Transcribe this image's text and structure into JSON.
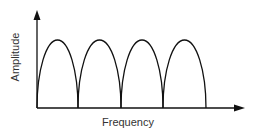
{
  "chart_data": {
    "type": "line",
    "title": "",
    "xlabel": "Frequency",
    "ylabel": "Amplitude",
    "grid": false,
    "legend": null,
    "lobes": [
      {
        "start": 0,
        "end": 1,
        "peak": 1
      },
      {
        "start": 1,
        "end": 2,
        "peak": 1
      },
      {
        "start": 2,
        "end": 3,
        "peak": 1
      },
      {
        "start": 3,
        "end": 4,
        "peak": 1
      }
    ],
    "x_ticks": [],
    "y_ticks": []
  },
  "colors": {
    "stroke": "#111111",
    "background": "#ffffff",
    "text": "#333333"
  },
  "geometry": {
    "origin": [
      37,
      108
    ],
    "y_axis_top": 10,
    "x_axis_right": 245,
    "lobe_boundaries": [
      37,
      78,
      121,
      163,
      206
    ],
    "peak_y": 40
  }
}
